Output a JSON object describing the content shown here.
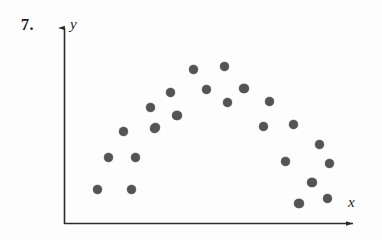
{
  "figure": {
    "problem_number": "7.",
    "background_color": "#fdfdfd",
    "ink_color": "#2b2b2b",
    "point_color": "#545454"
  },
  "axes": {
    "y_label": "y",
    "x_label": "x",
    "origin_px": [
      64,
      224
    ],
    "y_axis_top_px": 22,
    "x_axis_right_px": 360,
    "has_ticks": false,
    "has_gridlines": false,
    "has_tick_labels": false,
    "arrowheads": [
      "y-up",
      "x-right"
    ]
  },
  "chart_data": {
    "type": "scatter",
    "title": "",
    "subtitle": "",
    "xlabel": "x",
    "ylabel": "y",
    "grid": false,
    "legend": null,
    "legend_position": "none",
    "annotations": [
      "7."
    ],
    "shape_description": "points form an inverted-U / parabolic (quadratic) arch pattern",
    "xlim": [
      0,
      1
    ],
    "ylim": [
      0,
      1
    ],
    "axis_units": "unlabeled",
    "n_points": 28,
    "pixel_points": [
      [
        97,
        189
      ],
      [
        123,
        131
      ],
      [
        131,
        189
      ],
      [
        108,
        157
      ],
      [
        135,
        157
      ],
      [
        150,
        107
      ],
      [
        154,
        128
      ],
      [
        170,
        92
      ],
      [
        177,
        115
      ],
      [
        193,
        69
      ],
      [
        206,
        89
      ],
      [
        224,
        66
      ],
      [
        227,
        102
      ],
      [
        244,
        88
      ],
      [
        263,
        126
      ],
      [
        269,
        101
      ],
      [
        285,
        161
      ],
      [
        293,
        124
      ],
      [
        299,
        203
      ],
      [
        311,
        182
      ],
      [
        319,
        144
      ],
      [
        327,
        198
      ],
      [
        329,
        163
      ],
      [
        155,
        127
      ],
      [
        176,
        115
      ],
      [
        243,
        88
      ],
      [
        312,
        182
      ],
      [
        298,
        203
      ]
    ],
    "points": [
      {
        "x": 0.111,
        "y": 0.173
      },
      {
        "x": 0.199,
        "y": 0.46
      },
      {
        "x": 0.226,
        "y": 0.173
      },
      {
        "x": 0.149,
        "y": 0.331
      },
      {
        "x": 0.24,
        "y": 0.331
      },
      {
        "x": 0.29,
        "y": 0.579
      },
      {
        "x": 0.304,
        "y": 0.475
      },
      {
        "x": 0.358,
        "y": 0.653
      },
      {
        "x": 0.382,
        "y": 0.539
      },
      {
        "x": 0.436,
        "y": 0.767
      },
      {
        "x": 0.48,
        "y": 0.668
      },
      {
        "x": 0.541,
        "y": 0.782
      },
      {
        "x": 0.551,
        "y": 0.604
      },
      {
        "x": 0.608,
        "y": 0.673
      },
      {
        "x": 0.672,
        "y": 0.485
      },
      {
        "x": 0.693,
        "y": 0.609
      },
      {
        "x": 0.747,
        "y": 0.312
      },
      {
        "x": 0.774,
        "y": 0.495
      },
      {
        "x": 0.794,
        "y": 0.104
      },
      {
        "x": 0.835,
        "y": 0.208
      },
      {
        "x": 0.862,
        "y": 0.396
      },
      {
        "x": 0.889,
        "y": 0.129
      },
      {
        "x": 0.895,
        "y": 0.302
      },
      {
        "x": 0.307,
        "y": 0.48
      },
      {
        "x": 0.378,
        "y": 0.539
      },
      {
        "x": 0.605,
        "y": 0.673
      },
      {
        "x": 0.838,
        "y": 0.208
      },
      {
        "x": 0.791,
        "y": 0.104
      }
    ]
  }
}
